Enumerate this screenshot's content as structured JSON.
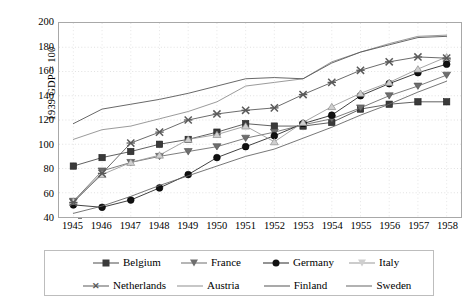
{
  "chart_data": {
    "type": "line",
    "title": "",
    "xlabel": "",
    "ylabel": "1939 GDP = 100",
    "x": [
      1945,
      1946,
      1947,
      1948,
      1949,
      1950,
      1951,
      1952,
      1953,
      1954,
      1955,
      1956,
      1957,
      1958
    ],
    "categories": [
      "1945",
      "1946",
      "1947",
      "1948",
      "1949",
      "1950",
      "1951",
      "1952",
      "1953",
      "1954",
      "1955",
      "1956",
      "1957",
      "1958"
    ],
    "ylim": [
      40,
      200
    ],
    "ytick_step": 20,
    "yticks": [
      40,
      60,
      80,
      100,
      120,
      140,
      160,
      180,
      200
    ],
    "grid": true,
    "legend_position": "bottom",
    "series": [
      {
        "name": "Belgium",
        "marker": "square",
        "marker_fill": "#3a3a3a",
        "color": "#4d4d4d",
        "values": [
          82,
          89,
          94,
          100,
          104,
          110,
          117,
          115,
          115,
          118,
          129,
          133,
          135,
          135
        ]
      },
      {
        "name": "France",
        "marker": "triangle-down",
        "marker_fill": "#6e6e6e",
        "color": "#6e6e6e",
        "values": [
          53,
          78,
          85,
          90,
          94,
          98,
          105,
          110,
          116,
          121,
          130,
          140,
          148,
          157
        ]
      },
      {
        "name": "Germany",
        "marker": "circle",
        "marker_fill": "#111111",
        "color": "#2b2b2b",
        "values": [
          50,
          48,
          54,
          64,
          75,
          89,
          98,
          107,
          117,
          124,
          140,
          150,
          159,
          166
        ]
      },
      {
        "name": "Italy",
        "marker": "triangle-light",
        "marker_fill": "#cfcfcf",
        "color": "#9a9a9a",
        "values": [
          53,
          75,
          85,
          91,
          104,
          108,
          115,
          102,
          118,
          131,
          142,
          151,
          162,
          172
        ]
      },
      {
        "name": "Netherlands",
        "marker": "x",
        "marker_fill": "#5a5a5a",
        "color": "#5a5a5a",
        "values": [
          52,
          76,
          101,
          110,
          120,
          125,
          128,
          130,
          141,
          151,
          161,
          168,
          172,
          171
        ]
      },
      {
        "name": "Austria",
        "marker": "none",
        "marker_fill": "#b5b5b5",
        "color": "#8f8f8f",
        "values": [
          104,
          112,
          115,
          121,
          127,
          135,
          148,
          151,
          154,
          168,
          176,
          183,
          189,
          190
        ]
      },
      {
        "name": "Finland",
        "marker": "none",
        "marker_fill": "#777777",
        "color": "#555555",
        "values": [
          117,
          129,
          133,
          137,
          142,
          148,
          154,
          155,
          154,
          167,
          176,
          182,
          188,
          189
        ]
      },
      {
        "name": "Sweden",
        "marker": "none",
        "marker_fill": "#777777",
        "color": "#666666",
        "values": [
          43,
          49,
          57,
          66,
          74,
          82,
          90,
          96,
          105,
          114,
          124,
          133,
          143,
          152
        ]
      }
    ]
  },
  "axis": {
    "y_title": "1939 GDP = 100"
  }
}
